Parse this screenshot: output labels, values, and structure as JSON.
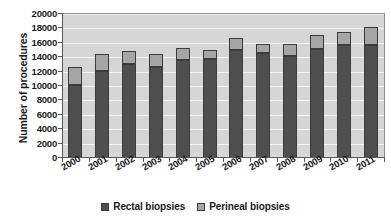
{
  "chart_data": {
    "type": "bar",
    "subtype": "stacked-bar",
    "title": "",
    "xlabel": "",
    "ylabel": "Number of procedures",
    "categories": [
      "2000",
      "2001",
      "2002",
      "2003",
      "2004",
      "2005",
      "2006",
      "2007",
      "2008",
      "2009",
      "2010",
      "2011"
    ],
    "series": [
      {
        "name": "Rectal biopsies",
        "color": "#4f4f4f",
        "values": [
          10200,
          12100,
          13000,
          12700,
          13550,
          13700,
          15050,
          14550,
          14150,
          15200,
          15750,
          15700
        ]
      },
      {
        "name": "Perineal biopsies",
        "color": "#a6a6a6",
        "values": [
          2400,
          2400,
          1900,
          1750,
          1750,
          1250,
          1600,
          1350,
          1650,
          1950,
          1800,
          2500
        ]
      }
    ],
    "totals": [
      12600,
      14500,
      14900,
      14450,
      15300,
      14950,
      16650,
      15900,
      15800,
      17150,
      17550,
      18200
    ],
    "ylim": [
      0,
      20000
    ],
    "ytick_step": 2000,
    "ytick_labels": [
      "0",
      "2000",
      "4000",
      "6000",
      "8000",
      "10000",
      "12000",
      "14000",
      "16000",
      "18000",
      "20000"
    ],
    "grid": true,
    "grid_axis": "y",
    "legend_position": "bottom",
    "plot_background": "#d6d6d6",
    "gridline_color": "#f3f3f3",
    "xtick_label_rotation": -30
  },
  "legend": {
    "items": [
      {
        "label": "Rectal biopsies",
        "swatch": "rectal"
      },
      {
        "label": "Perineal biopsies",
        "swatch": "perineal"
      }
    ]
  }
}
